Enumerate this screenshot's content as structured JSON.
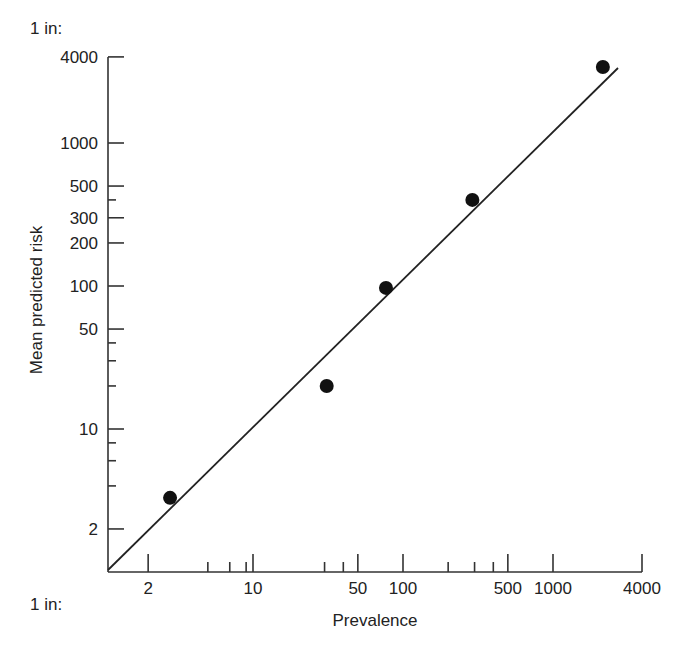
{
  "chart_data": {
    "type": "scatter",
    "title": "",
    "xlabel": "Prevalence",
    "ylabel": "Mean predicted risk",
    "x_unit_prefix": "1 in:",
    "y_unit_prefix": "1 in:",
    "xscale": "log",
    "yscale": "log",
    "xlim": [
      1,
      4000
    ],
    "ylim": [
      1,
      4000
    ],
    "grid": false,
    "legend": null,
    "x_ticks": [
      2,
      10,
      50,
      100,
      500,
      1000,
      4000
    ],
    "x_tick_labels": [
      "2",
      "10",
      "50",
      "100",
      "500",
      "1000",
      "4000"
    ],
    "x_minor_ticks": [
      5,
      7,
      9,
      30,
      40,
      200,
      300,
      400
    ],
    "y_ticks": [
      2,
      10,
      50,
      100,
      200,
      300,
      500,
      1000,
      4000
    ],
    "y_tick_labels": [
      "2",
      "10",
      "50",
      "100",
      "200",
      "300",
      "500",
      "1000",
      "4000"
    ],
    "y_minor_ticks": [
      4,
      6,
      8,
      20,
      30,
      40,
      400
    ],
    "series": [
      {
        "name": "observed",
        "marker": "filled-circle",
        "x": [
          2.8,
          31,
          77,
          290,
          2150
        ],
        "y": [
          3.3,
          20,
          97,
          400,
          3400
        ]
      },
      {
        "name": "identity line",
        "style": "line",
        "x": [
          1,
          2900
        ],
        "y": [
          1,
          3000
        ]
      }
    ]
  },
  "labels": {
    "y_prefix": "1 in:",
    "x_prefix": "1 in:",
    "xlabel": "Prevalence",
    "ylabel": "Mean predicted risk"
  }
}
